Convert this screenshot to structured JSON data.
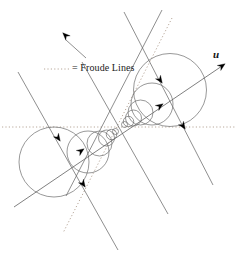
{
  "figure": {
    "title_text": "",
    "legend": {
      "sample_style": "dotted-line",
      "label": "= Froude Lines"
    },
    "axis_label": "u",
    "colors": {
      "circle_stroke": "#6b6b6b",
      "ray_stroke": "#5f5f5f",
      "froude_stroke": "#b8a89a",
      "arrow_fill": "#000000",
      "text": "#1a1a1a",
      "background": "#ffffff"
    }
  },
  "chart_data": {
    "type": "diagram",
    "xlabel": "",
    "ylabel": "",
    "source_point": {
      "x": 120,
      "y": 128
    },
    "direction_vector": {
      "dx": 0.8,
      "dy": -0.6,
      "label": "u"
    },
    "circles_right": [
      {
        "cx": 124.5,
        "cy": 124.5,
        "r": 3.0
      },
      {
        "cx": 128.5,
        "cy": 121.5,
        "r": 5.2
      },
      {
        "cx": 133.5,
        "cy": 118.0,
        "r": 8.0
      },
      {
        "cx": 140.5,
        "cy": 112.5,
        "r": 12.5
      },
      {
        "cx": 152.0,
        "cy": 104.0,
        "r": 21.0
      },
      {
        "cx": 170.0,
        "cy": 90.0,
        "r": 36.5
      }
    ],
    "circles_left": [
      {
        "cx": 115.5,
        "cy": 131.5,
        "r": 3.0
      },
      {
        "cx": 111.5,
        "cy": 134.5,
        "r": 5.2
      },
      {
        "cx": 106.5,
        "cy": 138.0,
        "r": 8.0
      },
      {
        "cx": 99.5,
        "cy": 143.5,
        "r": 12.5
      },
      {
        "cx": 88.0,
        "cy": 152.0,
        "r": 21.0
      },
      {
        "cx": 54.0,
        "cy": 162.0,
        "r": 35.0
      }
    ],
    "main_axis": {
      "x1": 14,
      "y1": 207,
      "x2": 222,
      "y2": 66,
      "arrow_at": "end"
    },
    "froude_lines": [
      {
        "name": "horizontal",
        "x1": 2,
        "y1": 127,
        "x2": 236,
        "y2": 127,
        "style": "dotted"
      },
      {
        "name": "upper-right",
        "x1": 172,
        "y1": 18,
        "x2": 63,
        "y2": 233,
        "style": "dotted"
      }
    ],
    "solid_rays": [
      {
        "x1": 18,
        "y1": 72,
        "x2": 118,
        "y2": 250
      },
      {
        "x1": 82,
        "y1": 62,
        "x2": 168,
        "y2": 214
      },
      {
        "x1": 124,
        "y1": 12,
        "x2": 213,
        "y2": 185
      },
      {
        "x1": 162,
        "y1": 10,
        "x2": 66,
        "y2": 196
      }
    ],
    "arrow_markers": [
      {
        "x": 68,
        "y": 38,
        "angle": 225,
        "name": "stray-arrow-top-left"
      },
      {
        "x": 158,
        "y": 77,
        "angle": 55,
        "name": "arrow-right-outer"
      },
      {
        "x": 157,
        "y": 108,
        "angle": 325,
        "name": "arrow-right-axis"
      },
      {
        "x": 181,
        "y": 123,
        "angle": 55,
        "name": "arrow-right-lower"
      },
      {
        "x": 56,
        "y": 135,
        "angle": 55,
        "name": "arrow-left-upper"
      },
      {
        "x": 78,
        "y": 153,
        "angle": 325,
        "name": "arrow-left-axis"
      },
      {
        "x": 81,
        "y": 181,
        "angle": 55,
        "name": "arrow-left-lower"
      },
      {
        "x": 219,
        "y": 68,
        "angle": 325,
        "name": "arrow-u-axis-tip"
      }
    ]
  }
}
